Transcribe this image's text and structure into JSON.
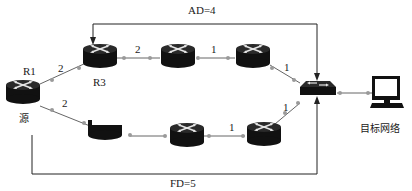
{
  "diagram": {
    "labels": {
      "ad": "AD=4",
      "fd": "FD=5",
      "r1": "R1",
      "r3": "R3",
      "source": "源",
      "target": "目标网络"
    },
    "link_costs": {
      "r1_r3": "2",
      "r1_bottom": "2",
      "r3_top_mid": "2",
      "top_mid_top_right": "1",
      "top_right_switch": "1",
      "bottom_mid_bottom_right": "1",
      "bottom_right_switch": "1"
    },
    "nodes": [
      {
        "id": "r1",
        "type": "router",
        "label": "R1"
      },
      {
        "id": "r3",
        "type": "router",
        "label": "R3"
      },
      {
        "id": "top-mid",
        "type": "router",
        "label": ""
      },
      {
        "id": "top-right",
        "type": "router",
        "label": ""
      },
      {
        "id": "bottom-left",
        "type": "router-partial",
        "label": ""
      },
      {
        "id": "bottom-mid",
        "type": "router",
        "label": ""
      },
      {
        "id": "bottom-right",
        "type": "router",
        "label": ""
      },
      {
        "id": "switch",
        "type": "switch",
        "label": ""
      },
      {
        "id": "target",
        "type": "computer",
        "label": "目标网络"
      }
    ],
    "colors": {
      "device": "#111111",
      "link": "#555555",
      "port": "#9a9a9a",
      "arrow": "#222222"
    }
  }
}
